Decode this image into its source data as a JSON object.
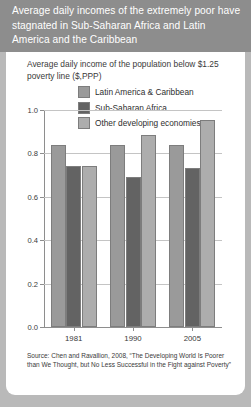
{
  "header": {
    "title": "Average daily incomes of the extremely poor have stagnated in Sub-Saharan Africa and Latin America and the Caribbean"
  },
  "subtitle": "Average daily income of the population below $1.25 poverty line ($,PPP)",
  "source": "Source: Chen and Ravallion, 2008, “The Developing World Is Poorer than We Thought, but No Less Successful in the Fight against Poverty”",
  "colors": {
    "header_background": "#8d8d8d",
    "card_background": "#ffffff",
    "page_background": "#b9b9b9",
    "latin_america": "#9a9a9a",
    "sub_saharan_africa": "#636363",
    "other_developing": "#adadad",
    "axis": "#8e8e8e",
    "gridline": "#c4c4c4",
    "text": "#3a3a3a"
  },
  "chart_data": {
    "type": "bar",
    "title": "Average daily incomes of the extremely poor have stagnated in Sub-Saharan Africa and Latin America and the Caribbean",
    "subtitle": "Average daily income of the population below $1.25 poverty line ($,PPP)",
    "xlabel": "",
    "ylabel": "",
    "categories": [
      "1981",
      "1990",
      "2005"
    ],
    "ylim": [
      0.0,
      1.0
    ],
    "yticks": [
      "0.0",
      "0.2",
      "0.4",
      "0.6",
      "0.8",
      "1.0"
    ],
    "ytick_values": [
      0.0,
      0.2,
      0.4,
      0.6,
      0.8,
      1.0
    ],
    "grid": true,
    "legend_position": "top-center",
    "series": [
      {
        "name": "Latin America & Caribbean",
        "color": "#9a9a9a",
        "values": [
          0.84,
          0.84,
          0.84
        ]
      },
      {
        "name": "Sub-Saharan Africa",
        "color": "#636363",
        "values": [
          0.74,
          0.69,
          0.735
        ]
      },
      {
        "name": "Other developing economies",
        "color": "#adadad",
        "values": [
          0.74,
          0.885,
          0.955
        ]
      }
    ],
    "source": "Source: Chen and Ravallion, 2008, “The Developing World Is Poorer than We Thought, but No Less Successful in the Fight against Poverty”"
  }
}
